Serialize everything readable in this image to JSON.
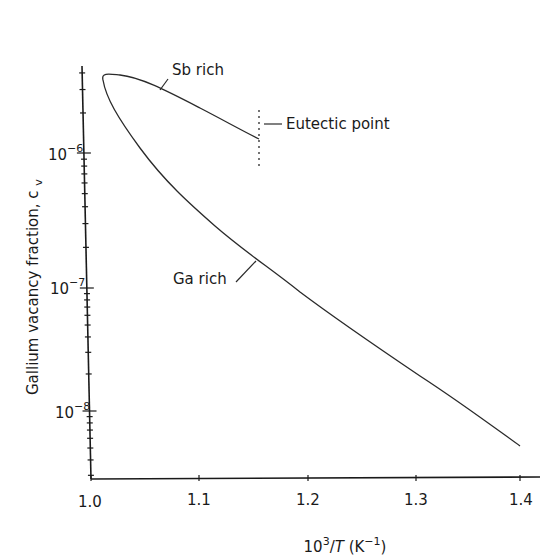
{
  "chart_data": {
    "type": "line",
    "title": "",
    "xlabel": "10^3/T (K^-1)",
    "xlabel_parts": {
      "base": "10",
      "sup": "3",
      "mid": "/",
      "var": "T",
      "unit_open": " (K",
      "unit_sup": "−1",
      "unit_close": ")"
    },
    "ylabel": "Gallium vacancy fraction, c_v",
    "ylabel_text": "Gallium vacancy fraction, c",
    "ylabel_sub": "v",
    "xlim": [
      1.0,
      1.42
    ],
    "ylim": [
      3e-09,
      1e-05
    ],
    "yscale": "log",
    "grid": false,
    "x_ticks": [
      "1.0",
      "1.1",
      "1.2",
      "1.3",
      "1.4"
    ],
    "y_ticks": [
      {
        "base": "10",
        "exp": "−6"
      },
      {
        "base": "10",
        "exp": "−7"
      },
      {
        "base": "10",
        "exp": "−8"
      }
    ],
    "series": [
      {
        "name": "Sb rich",
        "x": [
          1.011,
          1.018,
          1.027,
          1.045,
          1.065,
          1.1,
          1.13,
          1.156
        ],
        "y": [
          3.5e-06,
          3.75e-06,
          3.8e-06,
          3.4e-06,
          2.9e-06,
          2.1e-06,
          1.6e-06,
          1.17e-06
        ]
      },
      {
        "name": "Ga rich",
        "x": [
          1.011,
          1.022,
          1.05,
          1.1,
          1.15,
          1.2,
          1.25,
          1.3,
          1.35,
          1.4
        ],
        "y": [
          3.5e-06,
          2.2e-06,
          9.5e-07,
          3.6e-07,
          1.7e-07,
          8.9e-08,
          4.3e-08,
          2.1e-08,
          1.05e-08,
          5.2e-09
        ]
      }
    ],
    "annotations": [
      {
        "text": "Sb rich",
        "target": "upper branch"
      },
      {
        "text": "Ga rich",
        "target": "lower branch"
      },
      {
        "text": "Eutectic point",
        "x": 1.156,
        "style": "dotted vertical line"
      }
    ]
  },
  "labels": {
    "sb_rich": "Sb rich",
    "ga_rich": "Ga rich",
    "eutectic": "Eutectic point"
  }
}
